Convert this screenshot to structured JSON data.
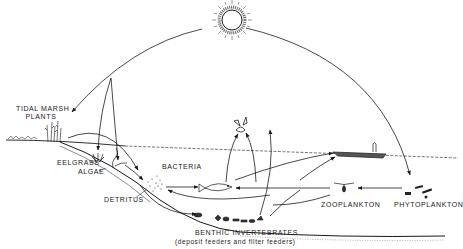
{
  "diagram": {
    "labels": {
      "tidal_marsh": "TIDAL MARSH",
      "plants": "PLANTS",
      "eelgrass": "EELGRASS",
      "algae": "ALGAE",
      "bacteria": "BACTERIA",
      "detritus": "DETRITUS",
      "zooplankton": "ZOOPLANKTON",
      "phytoplankton": "PHYTOPLANKTON",
      "benthic": "BENTHIC INVERTEBRATES",
      "benthic_sub": "(deposit feeders and filter feeders)"
    },
    "nodes": [
      "sun",
      "tidal-marsh-plants",
      "eelgrass",
      "algae",
      "bacteria",
      "detritus",
      "fish",
      "bird",
      "fisherman-boat",
      "zooplankton",
      "phytoplankton",
      "benthic-invertebrates"
    ],
    "colors": {
      "ink": "#1a1a1a",
      "background": "#ffffff"
    }
  }
}
